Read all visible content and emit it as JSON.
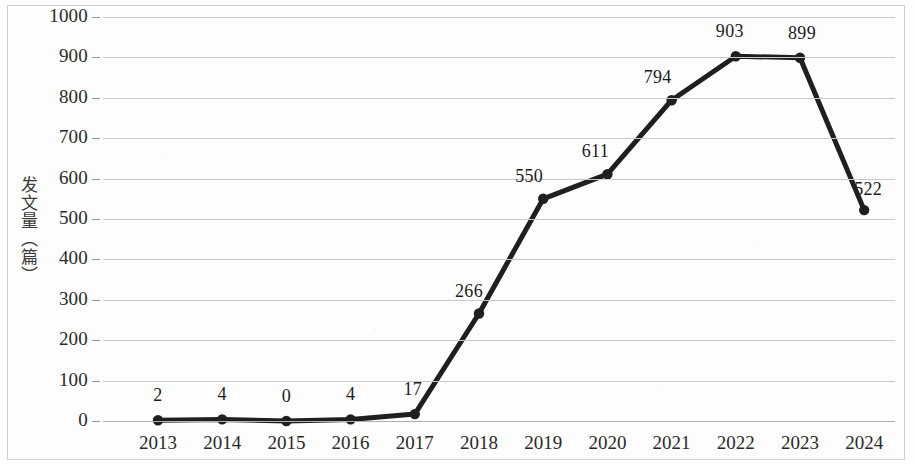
{
  "chart_data": {
    "type": "line",
    "title": "",
    "xlabel": "",
    "ylabel": "发文量（篇）",
    "categories": [
      "2013",
      "2014",
      "2015",
      "2016",
      "2017",
      "2018",
      "2019",
      "2020",
      "2021",
      "2022",
      "2023",
      "2024"
    ],
    "values": [
      2,
      4,
      0,
      4,
      17,
      266,
      550,
      611,
      794,
      903,
      899,
      522
    ],
    "data_labels": [
      "2",
      "4",
      "0",
      "4",
      "17",
      "266",
      "550",
      "611",
      "794",
      "903",
      "899",
      "522"
    ],
    "ylim": [
      0,
      1000
    ],
    "ytick_step": 100,
    "ytick_labels": [
      "1000",
      "900",
      "800",
      "700",
      "600",
      "500",
      "400",
      "300",
      "200",
      "100",
      "0"
    ],
    "ytick_values": [
      1000,
      900,
      800,
      700,
      600,
      500,
      400,
      300,
      200,
      100,
      0
    ],
    "grid": true,
    "legend": false,
    "legend_position": "none",
    "series_color": "#1f1f1f",
    "gridline_color": "#c9c9c9",
    "text_color": "#2a2a2a",
    "marker": "circle",
    "note": "2024 data label partially overlapped by the plotted line"
  }
}
